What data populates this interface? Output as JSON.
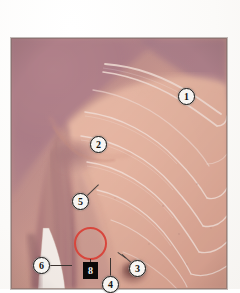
{
  "figure": {
    "kind": "anatomical-photograph",
    "subject_region": "right chest, shoulder and axilla with overlaid skeletal outlines",
    "background_color": "#fbfaf8",
    "plate": {
      "x": 11,
      "y": 38,
      "width": 216,
      "height": 251,
      "border_color": "#7a6964"
    },
    "palette": {
      "skin_light": "#e8b9a5",
      "skin_mid": "#d9a391",
      "skin_shadow": "#b98d84",
      "skin_mauve": "#b98b93",
      "skin_deep_mauve": "#a97d88",
      "bone_outline": "#f6e4dc",
      "annotation_red": "#d8463c",
      "label_fill": "#f7f5f2",
      "label_stroke": "#1d1a18",
      "box_fill": "#0a0908",
      "box_text": "#f4f2ef",
      "leader_line": "#3b3330",
      "white_gap": "#fdfbf7"
    },
    "overlays": {
      "skeleton_label": "clavicle and rib outlines drawn in pale line",
      "red_circle": {
        "shape": "circle",
        "center_x": 90,
        "center_y": 243,
        "radius": 16,
        "color": "#d8463c",
        "meaning": "highlighted region of interest"
      }
    },
    "callouts": [
      {
        "id": "callout-1",
        "label": "1",
        "shape": "circle",
        "x": 186,
        "y": 96,
        "points_to": "clavicle / acromion region",
        "has_leader": false
      },
      {
        "id": "callout-2",
        "label": "2",
        "shape": "circle",
        "x": 98,
        "y": 144,
        "points_to": "pectoralis major, anterior axillary fold",
        "has_leader": false
      },
      {
        "id": "callout-3",
        "label": "3",
        "shape": "circle",
        "x": 137,
        "y": 268,
        "points_to": "nipple / areola",
        "has_leader": true
      },
      {
        "id": "callout-4",
        "label": "4",
        "shape": "circle",
        "x": 110,
        "y": 284,
        "points_to": "inferior breast region",
        "has_leader": true
      },
      {
        "id": "callout-5",
        "label": "5",
        "shape": "circle",
        "x": 80,
        "y": 201,
        "points_to": "axilla / lateral chest wall",
        "has_leader": true
      },
      {
        "id": "callout-6",
        "label": "6",
        "shape": "circle",
        "x": 41,
        "y": 265,
        "points_to": "medial surface of upper arm",
        "has_leader": true
      },
      {
        "id": "callout-8",
        "label": "8",
        "shape": "box",
        "x": 90,
        "y": 270,
        "points_to": "red-circled area of interest",
        "has_leader": true
      }
    ]
  }
}
